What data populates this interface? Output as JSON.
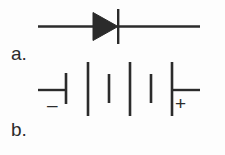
{
  "figure": {
    "background_color": "#fdfdfd",
    "stroke_color": "#2b2b2b",
    "width": 225,
    "height": 155
  },
  "parts": [
    {
      "key": "a",
      "label": "a.",
      "symbol_name": "diode",
      "description": "Diode schematic symbol: horizontal lead wire with a solid filled triangle pointing right meeting a vertical cathode bar."
    },
    {
      "key": "b",
      "label": "b.",
      "symbol_name": "battery",
      "description": "Battery schematic symbol: horizontal leads with alternating short and long vertical plate lines, negative terminal at left, positive terminal at right.",
      "negative_marker": "–",
      "positive_marker": "+"
    }
  ],
  "diode": {
    "lead_left": {
      "x1": 38,
      "y1": 26.5,
      "x2": 93,
      "y2": 26.5
    },
    "lead_right": {
      "x1": 118,
      "y1": 26.5,
      "x2": 200,
      "y2": 26.5
    },
    "triangle": {
      "points": "93,12.5 93,40.5 118,26.5"
    },
    "cathode_bar": {
      "x1": 118,
      "y1": 9,
      "x2": 118,
      "y2": 44
    },
    "stroke_width": 2.4
  },
  "battery": {
    "lead_left": {
      "x1": 38,
      "y1": 90,
      "x2": 66,
      "y2": 90
    },
    "lead_right": {
      "x1": 172,
      "y1": 90,
      "x2": 200,
      "y2": 90
    },
    "plates": [
      {
        "name": "plate-short-negative",
        "x": 66,
        "y1": 73,
        "y2": 104,
        "type": "short"
      },
      {
        "name": "plate-long-1",
        "x": 88,
        "y1": 62,
        "y2": 116,
        "type": "long"
      },
      {
        "name": "plate-short-2",
        "x": 109,
        "y1": 74,
        "y2": 103,
        "type": "short"
      },
      {
        "name": "plate-long-2",
        "x": 130,
        "y1": 62,
        "y2": 116,
        "type": "long"
      },
      {
        "name": "plate-short-3",
        "x": 151,
        "y1": 74,
        "y2": 103,
        "type": "short"
      },
      {
        "name": "plate-long-positive",
        "x": 172,
        "y1": 62,
        "y2": 116,
        "type": "long"
      }
    ],
    "stroke_width": 2.4
  }
}
